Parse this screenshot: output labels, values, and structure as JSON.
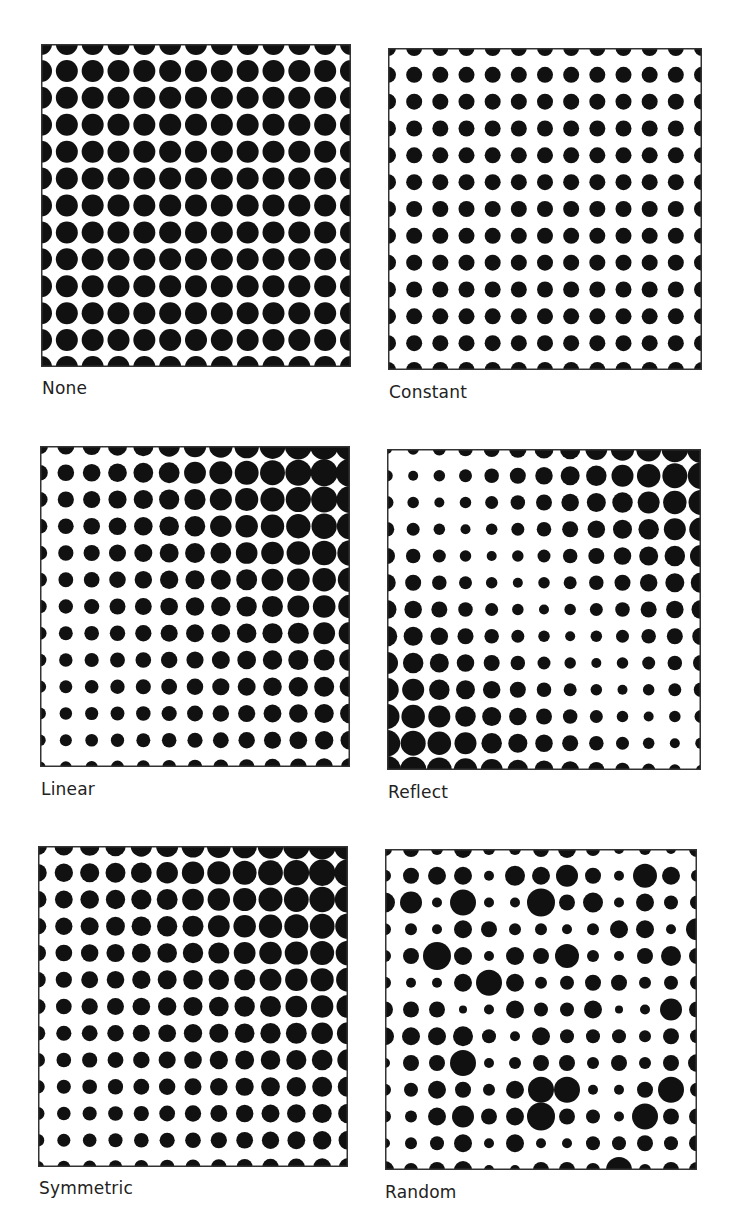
{
  "figure": {
    "grid_size": 13,
    "dot_color": "#111111",
    "frame_color": "#333333",
    "panels": [
      {
        "id": "none",
        "label": "None",
        "box": {
          "x": 41,
          "y": 44,
          "w": 310,
          "h": 323
        },
        "label_pos": {
          "x": 42,
          "y": 378
        },
        "mode": "constant",
        "radius": 11
      },
      {
        "id": "constant",
        "label": "Constant",
        "box": {
          "x": 388,
          "y": 48,
          "w": 314,
          "h": 322
        },
        "label_pos": {
          "x": 389,
          "y": 382
        },
        "mode": "constant",
        "radius": 8
      },
      {
        "id": "linear",
        "label": "Linear",
        "box": {
          "x": 40,
          "y": 446,
          "w": 310,
          "h": 321
        },
        "label_pos": {
          "x": 41,
          "y": 779
        },
        "mode": "bilinear",
        "corners": {
          "tl": 8,
          "tr": 14.5,
          "bl": 5.5,
          "br": 9
        }
      },
      {
        "id": "reflect",
        "label": "Reflect",
        "box": {
          "x": 387,
          "y": 449,
          "w": 314,
          "h": 321
        },
        "label_pos": {
          "x": 388,
          "y": 782
        },
        "mode": "reflect",
        "rmin": 5,
        "rmax": 14
      },
      {
        "id": "symmetric",
        "label": "Symmetric",
        "box": {
          "x": 38,
          "y": 846,
          "w": 310,
          "h": 321
        },
        "label_pos": {
          "x": 39,
          "y": 1178
        },
        "mode": "bilinear",
        "corners": {
          "tl": 9,
          "tr": 14,
          "bl": 6,
          "br": 9
        }
      },
      {
        "id": "random",
        "label": "Random",
        "box": {
          "x": 385,
          "y": 849,
          "w": 312,
          "h": 321
        },
        "label_pos": {
          "x": 385,
          "y": 1182
        },
        "mode": "grid",
        "radii": [
          [
            7,
            8,
            6,
            9,
            6,
            6,
            8,
            9,
            7,
            5,
            6,
            5,
            8
          ],
          [
            6,
            8,
            9,
            9,
            5,
            10,
            9,
            11,
            8,
            5,
            12,
            9,
            6
          ],
          [
            10,
            11,
            5,
            13,
            5,
            5,
            14,
            8,
            10,
            5,
            9,
            7,
            7
          ],
          [
            6,
            6,
            5,
            9,
            8,
            6,
            6,
            5,
            6,
            9,
            9,
            5,
            11
          ],
          [
            6,
            8,
            14,
            9,
            5,
            9,
            8,
            12,
            6,
            5,
            8,
            10,
            8
          ],
          [
            6,
            5,
            5,
            9,
            13,
            9,
            6,
            7,
            8,
            8,
            6,
            7,
            7
          ],
          [
            8,
            8,
            8,
            4,
            5,
            9,
            7,
            7,
            9,
            4,
            5,
            11,
            8
          ],
          [
            9,
            9,
            9,
            10,
            7,
            5,
            9,
            7,
            7,
            7,
            6,
            8,
            7
          ],
          [
            5,
            8,
            8,
            13,
            5,
            6,
            8,
            8,
            6,
            8,
            6,
            8,
            9
          ],
          [
            6,
            7,
            9,
            8,
            6,
            9,
            13,
            13,
            5,
            5,
            8,
            13,
            7
          ],
          [
            6,
            6,
            9,
            11,
            8,
            9,
            14,
            8,
            7,
            5,
            13,
            8,
            8
          ],
          [
            5,
            6,
            7,
            9,
            5,
            9,
            5,
            5,
            7,
            7,
            8,
            7,
            8
          ],
          [
            9,
            7,
            8,
            9,
            5,
            5,
            8,
            8,
            7,
            13,
            6,
            8,
            8
          ]
        ]
      }
    ]
  }
}
